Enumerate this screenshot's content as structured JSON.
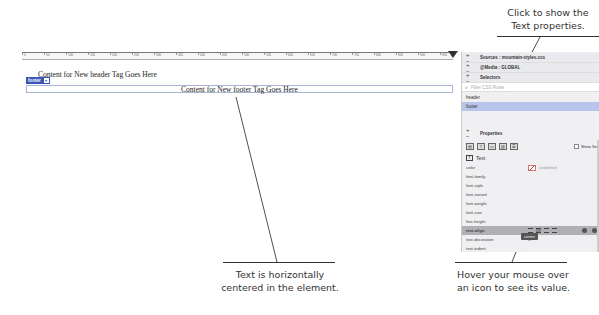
{
  "callouts": {
    "top_right": [
      "Click to show the",
      "Text properties."
    ],
    "bottom_center": [
      "Text is horizontally",
      "centered in the element."
    ],
    "bottom_right": [
      "Hover your mouse over",
      "an icon to see its value."
    ]
  },
  "ruler": {
    "ticks": [
      "0",
      "50",
      "100",
      "150",
      "200",
      "250",
      "300",
      "350",
      "400",
      "450",
      "500",
      "550",
      "600",
      "650",
      "700",
      "750",
      "800",
      "850",
      "900",
      "950"
    ]
  },
  "design_view": {
    "header_text": "Content for New header Tag Goes Here",
    "tag_badge": "footer",
    "tag_badge_menu": "▾",
    "footer_text": "Content for New footer Tag Goes Here"
  },
  "css_designer": {
    "sources_label": "Sources : mountain-styles.css",
    "media_label": "@Media : GLOBAL",
    "selectors_label": "Selectors",
    "filter_placeholder": "Filter CSS Rules",
    "selectors": [
      {
        "name": "header",
        "active": false
      },
      {
        "name": "footer",
        "active": true
      }
    ],
    "properties_label": "Properties",
    "show_set_label": "Show Set",
    "category_icons": [
      "layout",
      "text",
      "border",
      "background",
      "more"
    ],
    "text_section_label": "Text",
    "properties": [
      {
        "name": "color",
        "value": "undefined"
      },
      {
        "name": "font-family",
        "value": ""
      },
      {
        "name": "font-style",
        "value": ""
      },
      {
        "name": "font-variant",
        "value": ""
      },
      {
        "name": "font-weight",
        "value": ""
      },
      {
        "name": "font-size",
        "value": ""
      },
      {
        "name": "line-height",
        "value": ""
      },
      {
        "name": "text-align",
        "value": "center"
      },
      {
        "name": "text-decoration",
        "value": ""
      },
      {
        "name": "text-indent",
        "value": ""
      }
    ],
    "tooltip": "center"
  },
  "colors": {
    "accent": "#3a55b5",
    "selected_row": "#b8c4ea",
    "highlight_row": "#b0b0b4"
  }
}
